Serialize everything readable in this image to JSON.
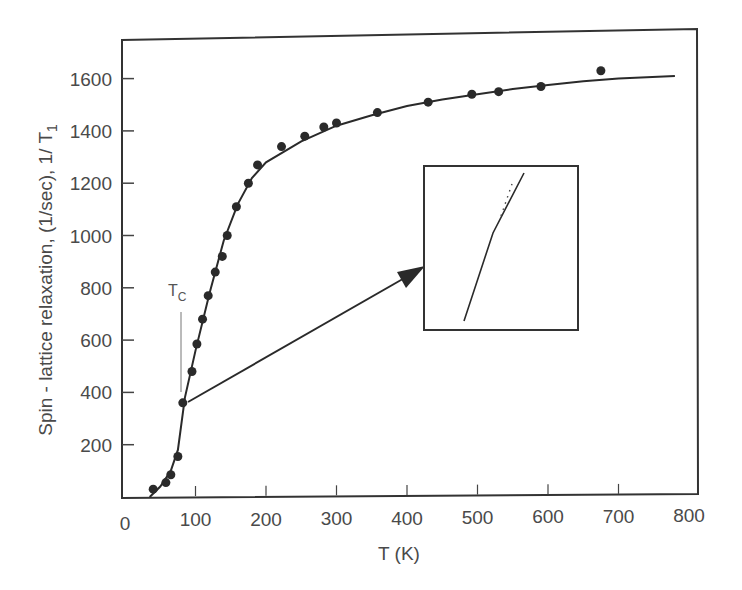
{
  "chart_data": {
    "type": "scatter",
    "title": "",
    "xlabel": "T (K)",
    "ylabel": "Spin - lattice relaxation, (1/sec), 1/ T",
    "ylabel_subscript": "1",
    "xlim": [
      0,
      800
    ],
    "ylim": [
      0,
      1700
    ],
    "x_ticks": [
      0,
      100,
      200,
      300,
      400,
      500,
      600,
      700,
      800
    ],
    "y_ticks": [
      200,
      400,
      600,
      800,
      1000,
      1200,
      1400,
      1600
    ],
    "grid": false,
    "legend": null,
    "annotation": {
      "tc_label": "T",
      "tc_subscript": "C",
      "tc_value_K": 78,
      "inset_description": "Magnified view near Tc showing a change in slope (kink) with dotted extrapolation"
    },
    "series": [
      {
        "name": "measured",
        "kind": "points",
        "x": [
          40,
          58,
          65,
          75,
          82,
          95,
          102,
          110,
          118,
          128,
          138,
          145,
          158,
          175,
          188,
          222,
          255,
          282,
          300,
          358,
          430,
          492,
          530,
          590,
          675
        ],
        "y": [
          30,
          55,
          85,
          155,
          360,
          480,
          585,
          680,
          770,
          860,
          920,
          1000,
          1110,
          1200,
          1270,
          1340,
          1380,
          1415,
          1430,
          1470,
          1510,
          1540,
          1550,
          1570,
          1630
        ]
      },
      {
        "name": "fit",
        "kind": "line",
        "x": [
          35,
          50,
          65,
          75,
          85,
          100,
          120,
          140,
          160,
          180,
          200,
          250,
          300,
          350,
          400,
          450,
          500,
          550,
          600,
          650,
          700,
          780
        ],
        "y": [
          0,
          40,
          100,
          180,
          380,
          560,
          780,
          980,
          1120,
          1220,
          1280,
          1360,
          1420,
          1460,
          1495,
          1520,
          1540,
          1560,
          1575,
          1590,
          1600,
          1610
        ]
      }
    ]
  }
}
